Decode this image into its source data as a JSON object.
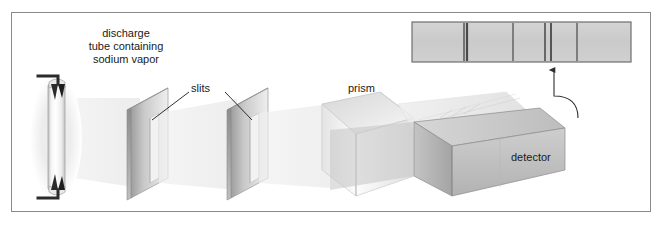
{
  "figure": {
    "title_text": "",
    "background_color": "#ffffff",
    "frame_color": "#8a8a8a",
    "text_color": "#1a1a1a"
  },
  "labels": {
    "discharge_tube": "discharge tube containing sodium vapor",
    "discharge_tube_line1": "discharge",
    "discharge_tube_line2": "tube containing",
    "discharge_tube_line3": "sodium vapor",
    "slits": "slits",
    "prism": "prism",
    "detector": "detector"
  },
  "components": {
    "discharge_tube": {
      "name": "discharge-tube",
      "glow_color": "#f2f2f2",
      "body_color": "#fbfbfb",
      "electrode_color": "#2b2b2b"
    },
    "slit_plate_1": {
      "name": "slit-plate-1",
      "face_color": "#d9d9d9",
      "edge_color": "#8f8f8f"
    },
    "slit_plate_2": {
      "name": "slit-plate-2",
      "face_color": "#d9d9d9",
      "edge_color": "#8f8f8f"
    },
    "prism": {
      "name": "prism",
      "face_color": "#e8e8e8",
      "edge_color": "#b5b5b5"
    },
    "detector": {
      "name": "detector",
      "face_color": "#c9c9c9",
      "edge_color": "#7a7a7a"
    },
    "light_beam": {
      "name": "light-beam",
      "color": "#ededed"
    },
    "pointer_arrow": {
      "name": "detector-to-spectrum-arrow",
      "color": "#3a3a3a"
    }
  },
  "chart_data": {
    "type": "line",
    "xlabel": "",
    "ylabel": "",
    "grid": false,
    "legend": "none",
    "spectrum_box": {
      "x": 412,
      "y": 22,
      "width": 219,
      "height": 40,
      "fill": "#cfcfcf",
      "border": "#6e6e6e"
    },
    "categories": [
      "line-1",
      "line-2",
      "line-3",
      "line-4",
      "line-5",
      "line-6"
    ],
    "values": [
      1,
      1,
      1,
      1,
      1,
      1
    ],
    "emission_lines": [
      {
        "label": "line-1",
        "x": 464,
        "width": 1.6,
        "color": "#5e5e5e"
      },
      {
        "label": "line-2",
        "x": 467,
        "width": 2.2,
        "color": "#4a4a4a"
      },
      {
        "label": "line-3",
        "x": 513,
        "width": 1.6,
        "color": "#6a6a6a"
      },
      {
        "label": "line-4",
        "x": 545,
        "width": 1.8,
        "color": "#5e5e5e"
      },
      {
        "label": "line-5",
        "x": 551,
        "width": 2.0,
        "color": "#555555"
      },
      {
        "label": "line-6",
        "x": 577,
        "width": 1.6,
        "color": "#6a6a6a"
      }
    ]
  }
}
